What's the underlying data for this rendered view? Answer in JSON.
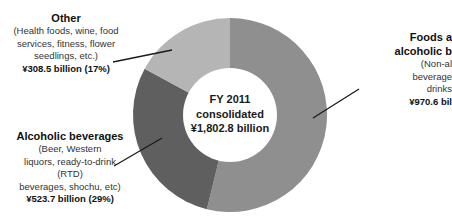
{
  "chart_data": {
    "type": "pie",
    "subtype": "donut",
    "title": "FY 2011 consolidated ¥1,802.8 billion",
    "center_label": [
      "FY 2011",
      "consolidated",
      "¥1,802.8 billion"
    ],
    "total": 1802.8,
    "unit": "¥ billion",
    "categories": [
      "Foods and non-alcoholic beverages",
      "Alcoholic beverages",
      "Other"
    ],
    "values": [
      970.6,
      523.7,
      308.5
    ],
    "percentages": [
      54,
      29,
      17
    ],
    "colors": [
      "#8f8f8f",
      "#5f5f5f",
      "#b5b5b5"
    ],
    "start_angle_deg": 0,
    "direction": "clockwise",
    "legend": "none (leader-line labels)"
  },
  "labels": {
    "other": {
      "title": "Other",
      "desc": [
        "(Health foods, wine, food",
        "services, fitness, flower",
        "seedlings, etc.)"
      ],
      "value": "¥308.5 billion (17%)"
    },
    "alcoholic": {
      "title": "Alcoholic beverages",
      "desc": [
        "(Beer, Western",
        "liquors, ready-to-drink",
        "(RTD)",
        "beverages, shochu, etc)"
      ],
      "value": "¥523.7 billion (29%)"
    },
    "foods": {
      "title": [
        "Foods a",
        "alcoholic b"
      ],
      "desc": [
        "(Non-al",
        "beverage",
        "drinks"
      ],
      "value": "¥970.6 bil"
    }
  },
  "center": {
    "line1": "FY 2011",
    "line2": "consolidated",
    "line3": "¥1,802.8 billion"
  }
}
